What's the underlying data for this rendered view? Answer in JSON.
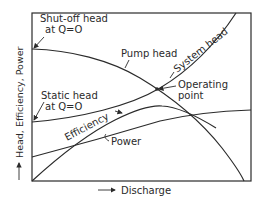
{
  "diagram": {
    "type": "pump characteristic curves",
    "axes": {
      "y_label": "Head, Efficiency, Power",
      "x_label": "Discharge"
    },
    "curves": [
      {
        "id": "pump_head",
        "label": "Pump head"
      },
      {
        "id": "system_head",
        "label": "System head"
      },
      {
        "id": "efficiency",
        "label": "Efficiency"
      },
      {
        "id": "power",
        "label": "Power"
      }
    ],
    "annotations": {
      "shutoff_line1": "Shut-off head",
      "shutoff_line2": "at Q=O",
      "static_line1": "Static head",
      "static_line2": "at Q=O",
      "operating_line1": "Operating",
      "operating_line2": "point"
    },
    "colors": {
      "line": "#2b2b2b",
      "background": "#ffffff"
    }
  }
}
